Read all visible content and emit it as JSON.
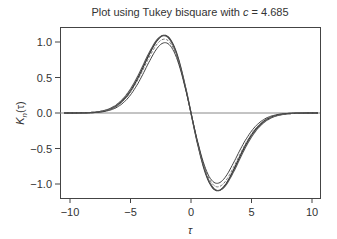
{
  "chart_data": {
    "type": "line",
    "title": "Plot using Tukey bisquare with c = 4.685",
    "title_prefix": "Plot using Tukey bisquare with ",
    "title_var": "c",
    "title_value": " = 4.685",
    "xlabel": "τ",
    "ylabel": "K_n(τ)",
    "ylabel_main": "K",
    "ylabel_sub": "n",
    "ylabel_arg": "(τ)",
    "xlim": [
      -10.7,
      10.7
    ],
    "ylim": [
      -1.2,
      1.2
    ],
    "xticks": [
      -10,
      -5,
      0,
      5,
      10
    ],
    "xtick_labels": [
      "−10",
      "−5",
      "0",
      "5",
      "10"
    ],
    "yticks": [
      1.0,
      0.5,
      0.0,
      -0.5,
      -1.0
    ],
    "ytick_labels": [
      "1.0",
      "0.5",
      "0.0",
      "−0.5",
      "−1.0"
    ],
    "reference_line_y": 0,
    "grid": false,
    "legend": null,
    "series": [
      {
        "name": "curve-1",
        "amplitude": 0.82,
        "sigma": 2.2,
        "peak": 1.1
      },
      {
        "name": "curve-2",
        "amplitude": 0.8,
        "sigma": 2.25,
        "peak": 1.08
      },
      {
        "name": "curve-3",
        "amplitude": 0.78,
        "sigma": 2.2,
        "peak": 1.05
      },
      {
        "name": "curve-4",
        "amplitude": 0.76,
        "sigma": 2.15,
        "peak": 1.02
      }
    ],
    "sample_points": {
      "x": [
        -10,
        -8,
        -6,
        -5,
        -4,
        -3,
        -2.2,
        -1,
        0,
        1,
        2.2,
        3,
        4,
        5,
        6,
        8,
        10
      ],
      "y": [
        0,
        0.0,
        0.05,
        0.15,
        0.53,
        0.94,
        1.07,
        0.72,
        0,
        -0.72,
        -1.07,
        -0.94,
        -0.53,
        -0.15,
        -0.05,
        0.0,
        0
      ]
    }
  }
}
